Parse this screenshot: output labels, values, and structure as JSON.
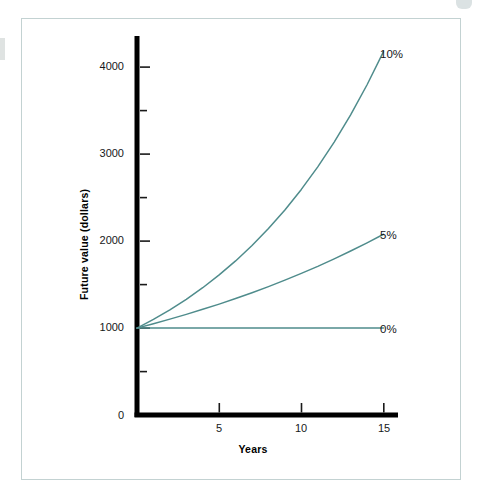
{
  "figure": {
    "frame_color": "#c3d2d2",
    "background": "#ffffff"
  },
  "chart_data": {
    "type": "line",
    "title": "",
    "subtitle": "",
    "xlabel": "Years",
    "ylabel": "Future value (dollars)",
    "xlim": [
      0,
      16
    ],
    "ylim": [
      0,
      4500
    ],
    "grid": false,
    "legend_position": "line-end-labels",
    "x_ticks": [
      5,
      10,
      15
    ],
    "x_tick_labels": [
      "5",
      "10",
      "15"
    ],
    "x_origin_label": "0",
    "y_ticks_major": [
      1000,
      2000,
      3000,
      4000
    ],
    "y_tick_labels": [
      "1000",
      "2000",
      "3000",
      "4000"
    ],
    "y_ticks_minor": [
      500,
      1500,
      2500,
      3500
    ],
    "y_origin_label": "0",
    "principal": 1000,
    "line_color": "#4f8c8c",
    "x": [
      0,
      1,
      2,
      3,
      4,
      5,
      6,
      7,
      8,
      9,
      10,
      11,
      12,
      13,
      14,
      15
    ],
    "series": [
      {
        "name": "10%",
        "label": "10%",
        "rate": 0.1,
        "color": "#4f8c8c",
        "values": [
          1000,
          1100,
          1210,
          1331,
          1464,
          1611,
          1772,
          1949,
          2144,
          2358,
          2594,
          2853,
          3138,
          3452,
          3797,
          4177
        ],
        "end_value": 4177
      },
      {
        "name": "5%",
        "label": "5%",
        "rate": 0.05,
        "color": "#4f8c8c",
        "values": [
          1000,
          1050,
          1103,
          1158,
          1216,
          1276,
          1340,
          1407,
          1477,
          1551,
          1629,
          1710,
          1796,
          1886,
          1980,
          2079
        ],
        "end_value": 2079
      },
      {
        "name": "0%",
        "label": "0%",
        "rate": 0.0,
        "color": "#4f8c8c",
        "values": [
          1000,
          1000,
          1000,
          1000,
          1000,
          1000,
          1000,
          1000,
          1000,
          1000,
          1000,
          1000,
          1000,
          1000,
          1000,
          1000
        ],
        "end_value": 1000
      }
    ]
  }
}
